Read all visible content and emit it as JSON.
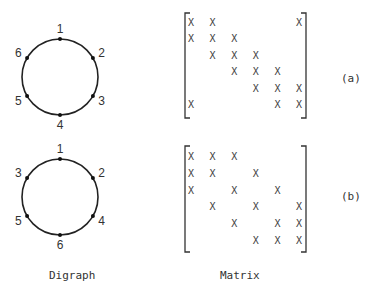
{
  "figures": [
    {
      "id": "a",
      "tag": "(a)",
      "digraph": {
        "nodes": [
          {
            "label": "1",
            "angle": -90
          },
          {
            "label": "2",
            "angle": -30
          },
          {
            "label": "3",
            "angle": 30
          },
          {
            "label": "4",
            "angle": 90
          },
          {
            "label": "5",
            "angle": 150
          },
          {
            "label": "6",
            "angle": 210
          }
        ]
      },
      "matrix": [
        [
          "X",
          "X",
          "",
          "",
          "",
          "X"
        ],
        [
          "X",
          "X",
          "X",
          "",
          "",
          ""
        ],
        [
          "",
          "X",
          "X",
          "X",
          "",
          ""
        ],
        [
          "",
          "",
          "X",
          "X",
          "X",
          ""
        ],
        [
          "",
          "",
          "",
          "X",
          "X",
          "X"
        ],
        [
          "X",
          "",
          "",
          "",
          "X",
          "X"
        ]
      ]
    },
    {
      "id": "b",
      "tag": "(b)",
      "digraph": {
        "nodes": [
          {
            "label": "1",
            "angle": -90
          },
          {
            "label": "2",
            "angle": -30
          },
          {
            "label": "4",
            "angle": 30
          },
          {
            "label": "6",
            "angle": 90
          },
          {
            "label": "5",
            "angle": 150
          },
          {
            "label": "3",
            "angle": 210
          }
        ]
      },
      "matrix": [
        [
          "X",
          "X",
          "X",
          "",
          "",
          ""
        ],
        [
          "X",
          "X",
          "",
          "X",
          "",
          ""
        ],
        [
          "X",
          "",
          "X",
          "",
          "X",
          ""
        ],
        [
          "",
          "X",
          "",
          "X",
          "",
          "X"
        ],
        [
          "",
          "",
          "X",
          "",
          "X",
          "X"
        ],
        [
          "",
          "",
          "",
          "X",
          "X",
          "X"
        ]
      ]
    }
  ],
  "captions": {
    "digraph": "Digraph",
    "matrix": "Matrix"
  }
}
